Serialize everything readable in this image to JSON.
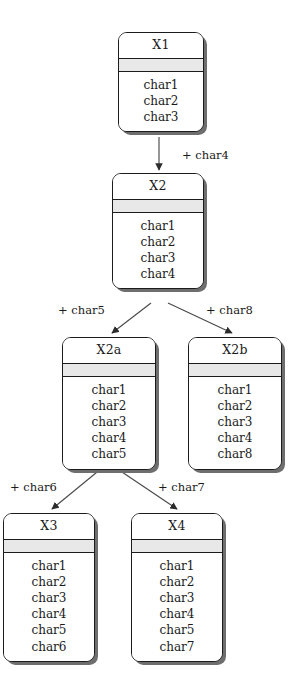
{
  "diagram": {
    "type": "class-refinement-tree",
    "background_color": "#ffffff",
    "node_fill": "#ffffff",
    "node_band_color": "#e8e8e8",
    "node_stroke": "#1c1c1c",
    "shadow_color": "#6e6e6e",
    "nodes": [
      {
        "id": "X1",
        "title": "X1",
        "attributes": [
          "char1",
          "char2",
          "char3"
        ],
        "x": 118,
        "y": 32,
        "width": 86
      },
      {
        "id": "X2",
        "title": "X2",
        "attributes": [
          "char1",
          "char2",
          "char3",
          "char4"
        ],
        "x": 112,
        "y": 173,
        "width": 92
      },
      {
        "id": "X2a",
        "title": "X2a",
        "attributes": [
          "char1",
          "char2",
          "char3",
          "char4",
          "char5"
        ],
        "x": 62,
        "y": 337,
        "width": 94
      },
      {
        "id": "X2b",
        "title": "X2b",
        "attributes": [
          "char1",
          "char2",
          "char3",
          "char4",
          "char8"
        ],
        "x": 188,
        "y": 337,
        "width": 94
      },
      {
        "id": "X3",
        "title": "X3",
        "attributes": [
          "char1",
          "char2",
          "char3",
          "char4",
          "char5",
          "char6"
        ],
        "x": 3,
        "y": 513,
        "width": 92
      },
      {
        "id": "X4",
        "title": "X4",
        "attributes": [
          "char1",
          "char2",
          "char3",
          "char4",
          "char5",
          "char7"
        ],
        "x": 131,
        "y": 513,
        "width": 92
      }
    ],
    "edges": [
      {
        "id": "edge-x1-x2",
        "from": "X1",
        "to": "X2",
        "label": "+ char4",
        "label_x": 182,
        "label_y": 150,
        "x1": 159,
        "y1": 137,
        "x2": 159,
        "y2": 170
      },
      {
        "id": "edge-x2-x2a",
        "from": "X2",
        "to": "X2a",
        "label": "+ char5",
        "label_x": 58,
        "label_y": 305,
        "x1": 151,
        "y1": 303,
        "x2": 112,
        "y2": 333
      },
      {
        "id": "edge-x2-x2b",
        "from": "X2",
        "to": "X2b",
        "label": "+ char8",
        "label_x": 206,
        "label_y": 305,
        "x1": 168,
        "y1": 303,
        "x2": 232,
        "y2": 333
      },
      {
        "id": "edge-x2a-x3",
        "from": "X2a",
        "to": "X3",
        "label": "+ char6",
        "label_x": 10,
        "label_y": 482,
        "x1": 102,
        "y1": 468,
        "x2": 52,
        "y2": 509
      },
      {
        "id": "edge-x2a-x4",
        "from": "X2a",
        "to": "X4",
        "label": "+ char7",
        "label_x": 158,
        "label_y": 482,
        "x1": 116,
        "y1": 468,
        "x2": 177,
        "y2": 509
      }
    ]
  }
}
